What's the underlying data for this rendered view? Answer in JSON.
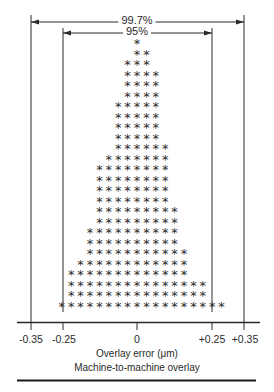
{
  "chart_data": {
    "type": "histogram",
    "subtype": "asterisk-dot-histogram",
    "title": "Machine-to-machine overlay",
    "xlabel": "Overlay error (μm)",
    "ylabel": "",
    "x_ticks": [
      "-0.35",
      "-0.25",
      "0",
      "+0.25",
      "+0.35"
    ],
    "x_tick_values": [
      -0.35,
      -0.25,
      0,
      0.25,
      0.35
    ],
    "xlim": [
      -0.35,
      0.35
    ],
    "grid": false,
    "legend": null,
    "annotations": [
      {
        "label": "99.7%",
        "from": -0.35,
        "to": 0.35
      },
      {
        "label": "95%",
        "from": -0.25,
        "to": 0.25
      }
    ],
    "symbol": "*",
    "row_spacing_note": "rows top to bottom; each row lists asterisk count and column start/end offsets relative to the 0 column (one column ≈ 0.031 μm)",
    "rows": [
      {
        "count": 1,
        "start": 0,
        "end": 0
      },
      {
        "count": 2,
        "start": 0,
        "end": 1
      },
      {
        "count": 3,
        "start": -1,
        "end": 1
      },
      {
        "count": 4,
        "start": -1,
        "end": 2
      },
      {
        "count": 4,
        "start": -1,
        "end": 2
      },
      {
        "count": 4,
        "start": -1,
        "end": 2
      },
      {
        "count": 5,
        "start": -2,
        "end": 2
      },
      {
        "count": 5,
        "start": -2,
        "end": 2
      },
      {
        "count": 5,
        "start": -2,
        "end": 2
      },
      {
        "count": 5,
        "start": -2,
        "end": 2
      },
      {
        "count": 6,
        "start": -2,
        "end": 3
      },
      {
        "count": 7,
        "start": -3,
        "end": 3
      },
      {
        "count": 8,
        "start": -4,
        "end": 3
      },
      {
        "count": 8,
        "start": -4,
        "end": 3
      },
      {
        "count": 8,
        "start": -4,
        "end": 3
      },
      {
        "count": 8,
        "start": -4,
        "end": 3
      },
      {
        "count": 9,
        "start": -4,
        "end": 4
      },
      {
        "count": 9,
        "start": -4,
        "end": 4
      },
      {
        "count": 10,
        "start": -5,
        "end": 4
      },
      {
        "count": 10,
        "start": -5,
        "end": 4
      },
      {
        "count": 11,
        "start": -5,
        "end": 5
      },
      {
        "count": 12,
        "start": -6,
        "end": 5
      },
      {
        "count": 13,
        "start": -7,
        "end": 5
      },
      {
        "count": 15,
        "start": -7,
        "end": 7
      },
      {
        "count": 15,
        "start": -7,
        "end": 7
      },
      {
        "count": 18,
        "start": -8,
        "end": 9
      }
    ]
  },
  "labels": {
    "pct_outer": "99.7%",
    "pct_inner": "95%",
    "tick_m035": "-0.35",
    "tick_m025": "-0.25",
    "tick_0": "0",
    "tick_p025": "+0.25",
    "tick_p035": "+0.35",
    "xlabel": "Overlay error (μm)",
    "caption": "Machine-to-machine overlay"
  },
  "colors": {
    "ink": "#2a2a2a",
    "background": "#ffffff"
  }
}
